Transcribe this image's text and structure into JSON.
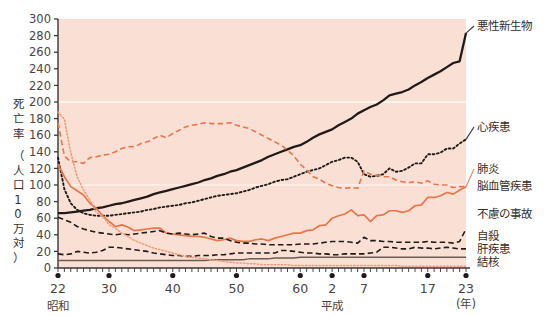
{
  "axis_title": {
    "text": "死亡率（人口10万対）",
    "chars_line1": [
      "死",
      "亡",
      "率"
    ],
    "chars_line2": [
      "（",
      "人",
      "口",
      "1",
      "0",
      "万",
      "対",
      "）"
    ]
  },
  "x_axis": {
    "unit_label": "(年)",
    "era_showa": "昭和",
    "era_heisei": "平成",
    "ticks": [
      {
        "label": "22",
        "year": 1947
      },
      {
        "label": "30",
        "year": 1955
      },
      {
        "label": "40",
        "year": 1965
      },
      {
        "label": "50",
        "year": 1975
      },
      {
        "label": "60",
        "year": 1985
      },
      {
        "label": "2",
        "year": 1990
      },
      {
        "label": "7",
        "year": 1995
      },
      {
        "label": "17",
        "year": 2005
      },
      {
        "label": "23",
        "year": 2011
      }
    ]
  },
  "y_axis": {
    "ticks": [
      "0",
      "20",
      "40",
      "60",
      "80",
      "100",
      "120",
      "140",
      "160",
      "180",
      "200",
      "220",
      "240",
      "260",
      "280",
      "300"
    ]
  },
  "colors": {
    "plot_background": "#fae0d4",
    "gridline": "#fdf2ec",
    "orange": "#e8764a",
    "orange_light": "#ef9b79",
    "black": "#201b19",
    "liver_brown": "#6d5a52",
    "text": "#3c3634"
  },
  "legend": [
    {
      "name": "悪性新生物",
      "color": "#201b19",
      "style": "solid"
    },
    {
      "name": "心疾患",
      "color": "#201b19",
      "style": "dotted"
    },
    {
      "name": "肺炎",
      "color": "#e8764a",
      "style": "solid"
    },
    {
      "name": "脳血管疾患",
      "color": "#e8764a",
      "style": "dashed"
    },
    {
      "name": "不慮の事故",
      "color": "#201b19",
      "style": "dashed"
    },
    {
      "name": "自殺",
      "color": "#201b19",
      "style": "dashed"
    },
    {
      "name": "肝疾患",
      "color": "#6d5a52",
      "style": "solid"
    },
    {
      "name": "結核",
      "color": "#ef9b79",
      "style": "dotted"
    }
  ],
  "chart_data": {
    "type": "line",
    "title": "",
    "xlabel": "(年)",
    "ylabel": "死亡率（人口10万対）",
    "xlim": [
      1947,
      2011
    ],
    "ylim": [
      0,
      300
    ],
    "ytick_step": 20,
    "grid": "single white gridline at y=200",
    "legend_position": "right of plot, at series end",
    "x": [
      1947,
      1948,
      1949,
      1950,
      1951,
      1952,
      1953,
      1954,
      1955,
      1956,
      1957,
      1958,
      1959,
      1960,
      1961,
      1962,
      1963,
      1964,
      1965,
      1966,
      1967,
      1968,
      1969,
      1970,
      1971,
      1972,
      1973,
      1974,
      1975,
      1976,
      1977,
      1978,
      1979,
      1980,
      1981,
      1982,
      1983,
      1984,
      1985,
      1986,
      1987,
      1988,
      1989,
      1990,
      1991,
      1992,
      1993,
      1994,
      1995,
      1996,
      1997,
      1998,
      1999,
      2000,
      2001,
      2002,
      2003,
      2004,
      2005,
      2006,
      2007,
      2008,
      2009,
      2010,
      2011
    ],
    "series": [
      {
        "name": "悪性新生物",
        "color": "#201b19",
        "style": "solid",
        "start_value": 66,
        "end_value": 283,
        "values": [
          66,
          66,
          67,
          68,
          69,
          70,
          72,
          73,
          75,
          77,
          78,
          80,
          82,
          84,
          86,
          89,
          91,
          93,
          95,
          97,
          99,
          101,
          103,
          106,
          108,
          111,
          113,
          116,
          118,
          121,
          124,
          127,
          130,
          134,
          137,
          140,
          143,
          146,
          148,
          152,
          157,
          161,
          164,
          167,
          172,
          176,
          180,
          186,
          190,
          194,
          197,
          202,
          208,
          210,
          212,
          215,
          220,
          224,
          229,
          233,
          237,
          242,
          247,
          249,
          283
        ]
      },
      {
        "name": "心疾患",
        "color": "#201b19",
        "style": "dotted",
        "start_value": 133,
        "end_value": 155,
        "values": [
          133,
          95,
          78,
          70,
          66,
          64,
          63,
          63,
          63,
          64,
          65,
          66,
          67,
          68,
          70,
          71,
          73,
          74,
          75,
          76,
          78,
          79,
          81,
          83,
          85,
          87,
          88,
          89,
          90,
          92,
          94,
          97,
          99,
          101,
          104,
          106,
          107,
          110,
          113,
          116,
          118,
          120,
          124,
          128,
          130,
          133,
          133,
          128,
          113,
          110,
          111,
          113,
          120,
          116,
          117,
          121,
          126,
          126,
          137,
          137,
          139,
          144,
          144,
          150,
          155
        ]
      },
      {
        "name": "肺炎",
        "color": "#e8764a",
        "style": "solid",
        "start_value": 125,
        "end_value": 98,
        "values": [
          125,
          110,
          98,
          93,
          88,
          78,
          72,
          63,
          56,
          50,
          52,
          49,
          45,
          46,
          47,
          48,
          48,
          42,
          41,
          40,
          39,
          38,
          38,
          37,
          35,
          33,
          34,
          36,
          33,
          32,
          32,
          34,
          35,
          33,
          36,
          38,
          40,
          42,
          42,
          45,
          46,
          51,
          52,
          60,
          63,
          65,
          70,
          63,
          64,
          56,
          63,
          64,
          69,
          69,
          67,
          69,
          75,
          76,
          85,
          85,
          87,
          91,
          89,
          94,
          98
        ]
      },
      {
        "name": "脳血管疾患",
        "color": "#e8764a",
        "style": "dashed",
        "start_value": 175,
        "end_value": 98,
        "values": [
          175,
          135,
          128,
          128,
          126,
          133,
          134,
          136,
          137,
          140,
          144,
          146,
          146,
          150,
          152,
          156,
          160,
          157,
          162,
          166,
          170,
          172,
          173,
          175,
          174,
          174,
          174,
          175,
          172,
          170,
          168,
          164,
          160,
          156,
          152,
          148,
          142,
          135,
          125,
          118,
          110,
          107,
          102,
          99,
          97,
          96,
          97,
          96,
          117,
          113,
          112,
          110,
          110,
          106,
          104,
          103,
          104,
          102,
          105,
          101,
          100,
          100,
          97,
          98,
          98
        ]
      },
      {
        "name": "不慮の事故",
        "color": "#201b19",
        "style": "dashed",
        "start_value": 61,
        "end_value": 47,
        "values": [
          61,
          58,
          55,
          50,
          47,
          45,
          43,
          42,
          41,
          40,
          41,
          40,
          41,
          42,
          43,
          44,
          45,
          42,
          41,
          42,
          41,
          40,
          41,
          42,
          38,
          36,
          36,
          33,
          31,
          30,
          30,
          29,
          29,
          28,
          28,
          28,
          28,
          28,
          29,
          29,
          29,
          30,
          31,
          32,
          32,
          32,
          31,
          30,
          37,
          33,
          33,
          32,
          32,
          31,
          31,
          31,
          31,
          31,
          32,
          31,
          31,
          31,
          30,
          32,
          47
        ]
      },
      {
        "name": "自殺",
        "color": "#201b19",
        "style": "dashed",
        "start_value": 17,
        "end_value": 23,
        "values": [
          17,
          16,
          17,
          20,
          19,
          18,
          19,
          21,
          25,
          25,
          24,
          23,
          22,
          21,
          20,
          18,
          17,
          16,
          15,
          15,
          14,
          14,
          15,
          15,
          15,
          16,
          16,
          17,
          18,
          18,
          18,
          18,
          18,
          18,
          18,
          21,
          21,
          20,
          19,
          18,
          18,
          17,
          17,
          16,
          16,
          17,
          17,
          17,
          17,
          18,
          19,
          25,
          25,
          24,
          23,
          23,
          25,
          24,
          24,
          23,
          24,
          25,
          24,
          23,
          23
        ]
      },
      {
        "name": "肝疾患",
        "color": "#6d5a52",
        "style": "solid",
        "start_value": 9,
        "end_value": 13,
        "values": [
          9,
          9,
          9,
          9,
          9,
          9,
          9,
          9,
          9,
          9,
          9,
          9,
          9,
          9,
          9,
          9,
          9,
          9,
          9,
          9,
          9,
          9,
          9,
          9,
          10,
          10,
          10,
          10,
          10,
          10,
          11,
          11,
          11,
          11,
          12,
          12,
          12,
          12,
          13,
          13,
          13,
          13,
          13,
          13,
          13,
          13,
          13,
          13,
          13,
          13,
          13,
          13,
          13,
          13,
          13,
          13,
          13,
          13,
          13,
          13,
          13,
          13,
          13,
          13,
          13
        ]
      },
      {
        "name": "結核",
        "color": "#ef9b79",
        "style": "dotted",
        "start_value": 188,
        "end_value": 2,
        "values": [
          188,
          179,
          139,
          110,
          94,
          82,
          67,
          62,
          52,
          48,
          42,
          38,
          33,
          30,
          27,
          24,
          22,
          20,
          18,
          16,
          14,
          13,
          12,
          11,
          10,
          9,
          8,
          7,
          6,
          6,
          5,
          5,
          4,
          4,
          4,
          4,
          4,
          3,
          3,
          3,
          3,
          3,
          3,
          3,
          3,
          3,
          3,
          3,
          3,
          3,
          3,
          3,
          3,
          3,
          2,
          2,
          2,
          2,
          2,
          2,
          2,
          2,
          2,
          2,
          2
        ]
      }
    ]
  }
}
